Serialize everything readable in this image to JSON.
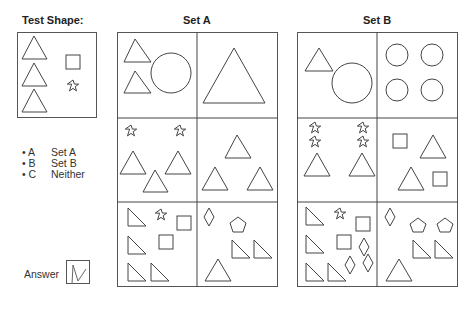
{
  "titles": {
    "test_shape": "Test Shape:",
    "set_a": "Set A",
    "set_b": "Set B"
  },
  "options": [
    {
      "key": "• A",
      "label": "Set A"
    },
    {
      "key": "• B",
      "label": "Set B"
    },
    {
      "key": "• C",
      "label": "Neither"
    }
  ],
  "answer": {
    "label": "Answer",
    "marked": true
  },
  "test_shape": {
    "contents": [
      "triangle",
      "triangle",
      "triangle",
      "square",
      "star"
    ]
  },
  "set_a": {
    "cells": [
      {
        "contents": [
          "triangle",
          "triangle",
          "circle"
        ]
      },
      {
        "contents": [
          "large triangle"
        ]
      },
      {
        "contents": [
          "star",
          "star",
          "triangle",
          "triangle",
          "triangle"
        ]
      },
      {
        "contents": [
          "triangle",
          "triangle",
          "triangle"
        ]
      },
      {
        "contents": [
          "right triangle",
          "right triangle",
          "right triangle",
          "right triangle",
          "star",
          "square",
          "square"
        ]
      },
      {
        "contents": [
          "diamond",
          "pentagon",
          "right triangle",
          "right triangle",
          "triangle"
        ]
      }
    ]
  },
  "set_b": {
    "cells": [
      {
        "contents": [
          "triangle",
          "circle"
        ]
      },
      {
        "contents": [
          "circle",
          "circle",
          "circle",
          "circle"
        ]
      },
      {
        "contents": [
          "star",
          "star",
          "star",
          "star",
          "triangle",
          "triangle"
        ]
      },
      {
        "contents": [
          "square",
          "square",
          "triangle",
          "triangle"
        ]
      },
      {
        "contents": [
          "right triangle",
          "right triangle",
          "right triangle",
          "right triangle",
          "star",
          "square",
          "square",
          "diamond",
          "diamond",
          "diamond"
        ]
      },
      {
        "contents": [
          "diamond",
          "pentagon",
          "pentagon",
          "right triangle",
          "right triangle",
          "triangle"
        ]
      }
    ]
  }
}
